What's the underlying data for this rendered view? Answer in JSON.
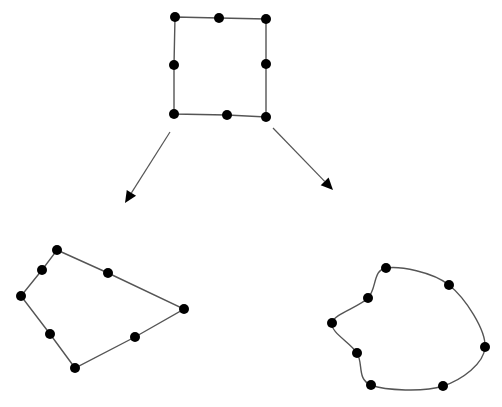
{
  "diagram": {
    "width": 502,
    "height": 407,
    "background": "#ffffff",
    "edge_color": "#555555",
    "node_color": "#000000",
    "node_radius": 5,
    "shapes": [
      {
        "id": "source-square",
        "kind": "polygon",
        "description": "Original square with 8 control points",
        "nodes": [
          [
            175,
            17
          ],
          [
            219,
            18
          ],
          [
            266,
            19
          ],
          [
            266,
            64
          ],
          [
            266,
            117
          ],
          [
            227,
            115
          ],
          [
            174,
            114
          ],
          [
            174,
            65
          ]
        ]
      },
      {
        "id": "linear-deformation",
        "kind": "polygon",
        "description": "Square mapped to a quadrilateral (straight edges)",
        "nodes": [
          [
            57,
            250
          ],
          [
            108,
            273
          ],
          [
            184,
            309
          ],
          [
            135,
            337
          ],
          [
            75,
            368
          ],
          [
            50,
            334
          ],
          [
            21,
            296
          ],
          [
            42,
            270
          ]
        ]
      },
      {
        "id": "curved-deformation",
        "kind": "curve",
        "description": "Square mapped to a curved shape (smooth edges)",
        "nodes": [
          [
            386,
            268
          ],
          [
            449,
            285
          ],
          [
            485,
            347
          ],
          [
            443,
            386
          ],
          [
            371,
            385
          ],
          [
            357,
            353
          ],
          [
            332,
            323
          ],
          [
            368,
            298
          ]
        ]
      }
    ],
    "arrows": [
      {
        "id": "arrow-left",
        "from": [
          170,
          132
        ],
        "to": [
          125,
          203
        ]
      },
      {
        "id": "arrow-right",
        "from": [
          273,
          128
        ],
        "to": [
          333,
          190
        ]
      }
    ]
  }
}
